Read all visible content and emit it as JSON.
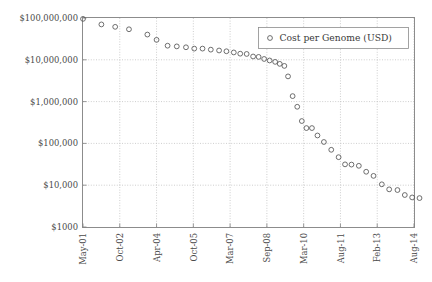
{
  "chart_data": {
    "type": "scatter",
    "title": "",
    "xlabel": "",
    "ylabel": "",
    "legend": [
      "Cost per Genome (USD)"
    ],
    "legend_position": "top-right",
    "grid": true,
    "yscale": "log",
    "ylim": [
      1000,
      100000000
    ],
    "ytick_labels": [
      "$100,000,000",
      "$10,000,000",
      "$1,000,000",
      "$100,000",
      "$10,000",
      "$1000"
    ],
    "ytick_values": [
      100000000,
      10000000,
      1000000,
      100000,
      10000,
      1000
    ],
    "xtick_labels": [
      "May-01",
      "Oct-02",
      "Apr-04",
      "Oct-05",
      "Mar-07",
      "Sep-08",
      "Mar-10",
      "Aug-11",
      "Feb-13",
      "Aug-14"
    ],
    "xtick_index": [
      0,
      4,
      8,
      12,
      16,
      20,
      24,
      28,
      32,
      36
    ],
    "x": [
      0,
      2,
      3.5,
      5,
      7,
      8,
      9.2,
      10.2,
      11.2,
      12.1,
      13.0,
      13.9,
      14.8,
      15.6,
      16.4,
      17.1,
      17.8,
      18.5,
      19.1,
      19.7,
      20.3,
      20.9,
      21.4,
      21.9,
      22.3,
      22.8,
      23.3,
      23.8,
      24.3,
      24.9,
      25.5,
      26.2,
      27.0,
      27.8,
      28.5,
      29.2,
      30.0,
      30.8,
      31.6,
      32.5,
      33.3,
      34.2,
      35.0,
      35.8,
      36.6
    ],
    "values": [
      95263072,
      70175437,
      61448422,
      53751684,
      40157554,
      30000000,
      21743003,
      20935599,
      19934346,
      18519312,
      18519312,
      17500000,
      16712371,
      16000000,
      15000000,
      14000000,
      13801124,
      12000000,
      11732535,
      10474556,
      9635000,
      8927342,
      8000000,
      7147571,
      4008341,
      1352982,
      752080,
      342502,
      232735,
      232735,
      154714,
      108065,
      70333,
      46774,
      31512,
      31125,
      29092,
      20963,
      16712,
      10497,
      7950,
      7666,
      5826,
      5096,
      4920
    ],
    "marker": "open-circle",
    "marker_color": "#555555"
  },
  "legend": {
    "series_label": "Cost per Genome (USD)"
  }
}
